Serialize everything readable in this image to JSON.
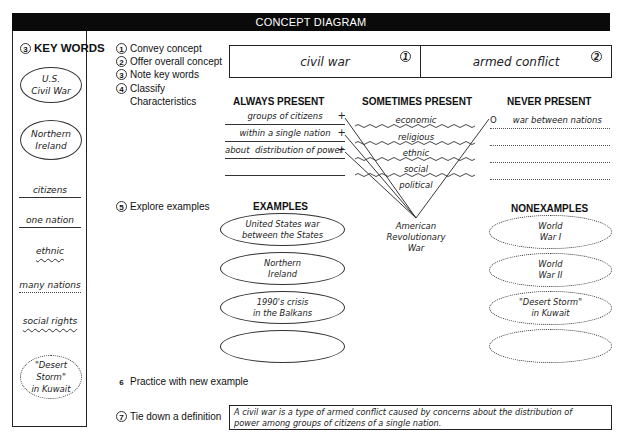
{
  "header": {
    "title": "CONCEPT DIAGRAM"
  },
  "key_words": {
    "number": "3",
    "title": "KEY WORDS",
    "items": [
      {
        "text_line1": "U.S.",
        "text_line2": "Civil War",
        "style": "oval-solid"
      },
      {
        "text_line1": "Northern",
        "text_line2": "Ireland",
        "style": "oval-solid"
      },
      {
        "text": "citizens",
        "style": "underline-solid"
      },
      {
        "text": "one nation",
        "style": "underline-solid"
      },
      {
        "text": "ethnic",
        "style": "underline-wavy"
      },
      {
        "text": "many nations",
        "style": "underline-dotted"
      },
      {
        "text": "social rights",
        "style": "underline-wavy"
      },
      {
        "text_line1": "\"Desert Storm\"",
        "text_line2": "in Kuwait",
        "style": "oval-dotted"
      }
    ]
  },
  "steps": [
    {
      "number": "1",
      "label": "Convey concept"
    },
    {
      "number": "2",
      "label": "Offer overall concept"
    },
    {
      "number": "3",
      "label": "Note key words"
    },
    {
      "number": "4",
      "label": "Classify",
      "label2": "Characteristics"
    },
    {
      "number": "5",
      "label": "Explore examples"
    },
    {
      "number": "6",
      "label": "Practice with new example"
    },
    {
      "number": "7",
      "label": "Tie down a definition"
    }
  ],
  "concept": {
    "concept_label": "civil war",
    "concept_number": "1",
    "overall_label": "armed conflict",
    "overall_number": "2"
  },
  "characteristics": {
    "always_present": {
      "title": "ALWAYS PRESENT",
      "items": [
        "groups of citizens",
        "within a single nation",
        "about  distribution of power",
        ""
      ],
      "marker": "+"
    },
    "sometimes_present": {
      "title": "SOMETIMES PRESENT",
      "items": [
        "economic",
        "religious",
        "ethnic",
        "social",
        "political"
      ]
    },
    "never_present": {
      "title": "NEVER PRESENT",
      "items": [
        "war between nations",
        "",
        "",
        ""
      ],
      "marker": "O"
    },
    "convergence_label": {
      "line1": "American",
      "line2": "Revolutionary",
      "line3": "War"
    }
  },
  "examples": {
    "title": "EXAMPLES",
    "items": [
      {
        "line1": "United States war",
        "line2": "between the States"
      },
      {
        "line1": "Northern",
        "line2": "Ireland"
      },
      {
        "line1": "1990's crisis",
        "line2": "in the Balkans"
      },
      {
        "line1": "",
        "line2": ""
      }
    ]
  },
  "nonexamples": {
    "title": "NONEXAMPLES",
    "items": [
      {
        "line1": "World",
        "line2": "War I"
      },
      {
        "line1": "World",
        "line2": "War II"
      },
      {
        "line1": "\"Desert Storm\"",
        "line2": "in Kuwait"
      },
      {
        "line1": "",
        "line2": ""
      }
    ]
  },
  "definition": {
    "line1": "A civil war is a type of armed conflict caused by concerns about the distribution of",
    "line2": "power among groups of citizens of a single nation."
  }
}
